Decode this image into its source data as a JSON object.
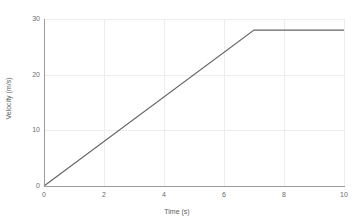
{
  "chart_data": {
    "type": "line",
    "title": "",
    "subtitle": "",
    "xlabel": "Time (s)",
    "ylabel": "Velocity (m/s)",
    "xlim": [
      0,
      10
    ],
    "ylim": [
      0,
      30
    ],
    "xticks": [
      "0",
      "2",
      "4",
      "6",
      "8",
      "10"
    ],
    "xtick_values": [
      0,
      2,
      4,
      6,
      8,
      10
    ],
    "yticks": [
      "0",
      "10",
      "20",
      "30"
    ],
    "ytick_values": [
      0,
      10,
      20,
      30
    ],
    "grid": true,
    "legend": "none",
    "line_color": "#646464",
    "grid_color": "#ededed",
    "axis_color": "#9a9a9a",
    "tick_text_color": "#6b6b6b",
    "background": "#ffffff",
    "series": [
      {
        "name": "velocity",
        "x": [
          0,
          7,
          10
        ],
        "values": [
          0,
          28,
          28
        ]
      }
    ],
    "annotations": []
  },
  "accessibility": {
    "description": "Velocity versus time graph: linear increase from 0 to 28 m/s between 0 s and 7 s, then constant at 28 m/s until 10 s."
  }
}
